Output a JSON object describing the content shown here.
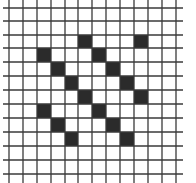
{
  "grid": {
    "columns": 12,
    "rows": 12,
    "line_color": "#3a3a3a",
    "fill_color": "#2b2b2b",
    "background": "#ffffff",
    "vertical_lines_x": [
      9,
      23,
      37,
      51,
      65,
      78,
      92,
      106,
      120,
      134,
      148,
      162,
      176
    ],
    "horizontal_lines_y": [
      8,
      21,
      35,
      48,
      62,
      76,
      90,
      104,
      118,
      132,
      146,
      160,
      174
    ],
    "filled_cells": [
      {
        "row": 2,
        "col": 5
      },
      {
        "row": 2,
        "col": 9
      },
      {
        "row": 3,
        "col": 2
      },
      {
        "row": 3,
        "col": 6
      },
      {
        "row": 4,
        "col": 3
      },
      {
        "row": 4,
        "col": 7
      },
      {
        "row": 5,
        "col": 4
      },
      {
        "row": 5,
        "col": 8
      },
      {
        "row": 6,
        "col": 5
      },
      {
        "row": 6,
        "col": 9
      },
      {
        "row": 7,
        "col": 2
      },
      {
        "row": 7,
        "col": 6
      },
      {
        "row": 8,
        "col": 3
      },
      {
        "row": 8,
        "col": 7
      },
      {
        "row": 9,
        "col": 4
      },
      {
        "row": 9,
        "col": 8
      }
    ]
  }
}
